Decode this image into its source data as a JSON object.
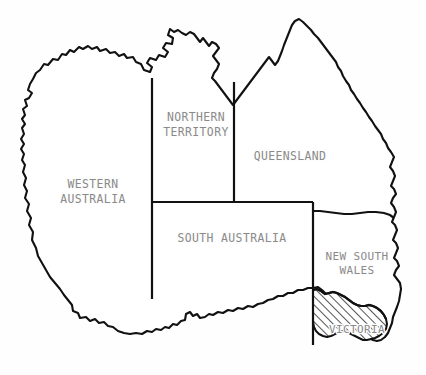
{
  "map": {
    "title": "Map of Australia showing states and territories",
    "region": "Australia",
    "background_color": "#fefefe",
    "outline_color": "#111111",
    "label_color": "#8a8a8a",
    "highlight": {
      "name": "Victoria",
      "fill_style": "diagonal-hatch",
      "hatch_color": "#111111",
      "hatch_direction": "forward-slash"
    },
    "states": [
      {
        "id": "western-australia",
        "label_lines": [
          "WESTERN",
          "AUSTRALIA"
        ],
        "label_x": 93,
        "label_y": 190,
        "highlighted": false
      },
      {
        "id": "northern-territory",
        "label_lines": [
          "NORTHERN",
          "TERRITORY"
        ],
        "label_x": 196,
        "label_y": 123,
        "highlighted": false
      },
      {
        "id": "queensland",
        "label_lines": [
          "QUEENSLAND"
        ],
        "label_x": 290,
        "label_y": 156,
        "highlighted": false
      },
      {
        "id": "south-australia",
        "label_lines": [
          "SOUTH AUSTRALIA"
        ],
        "label_x": 232,
        "label_y": 238,
        "highlighted": false
      },
      {
        "id": "new-south-wales",
        "label_lines": [
          "NEW SOUTH",
          "WALES"
        ],
        "label_x": 355,
        "label_y": 263,
        "highlighted": false
      },
      {
        "id": "victoria",
        "label_lines": [
          "VICTORIA"
        ],
        "label_x": 357,
        "label_y": 330,
        "highlighted": true
      }
    ]
  }
}
